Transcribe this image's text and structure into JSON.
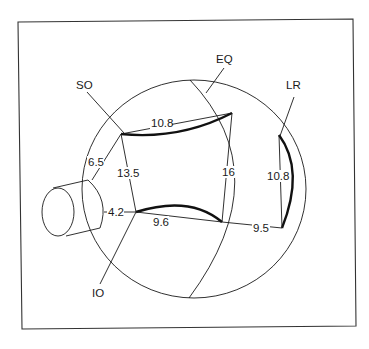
{
  "diagram": {
    "type": "eye-muscle-insertion-diagram",
    "colors": {
      "line": "#1a1a1a",
      "background": "#ffffff",
      "frame": "#333333"
    },
    "labels": {
      "superior_oblique": "SO",
      "equator": "EQ",
      "lateral_rectus": "LR",
      "inferior_oblique": "IO"
    },
    "measurements": {
      "so_insertion_width": "10.8",
      "so_to_nerve": "6.5",
      "so_to_io": "13.5",
      "io_to_nerve": "4.2",
      "io_insertion_width": "9.6",
      "so_to_io_anterior": "16",
      "io_to_lr": "9.5",
      "lr_insertion_width": "10.8"
    }
  }
}
